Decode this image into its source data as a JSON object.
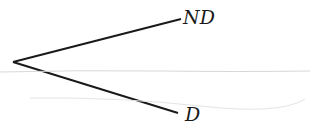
{
  "diagram": {
    "type": "tree",
    "root": {
      "x": 13,
      "y": 62
    },
    "branches": [
      {
        "label": "ND",
        "end": {
          "x": 181,
          "y": 19
        }
      },
      {
        "label": "D",
        "end": {
          "x": 178,
          "y": 113
        }
      }
    ],
    "line_color": "#1a1a1a"
  }
}
